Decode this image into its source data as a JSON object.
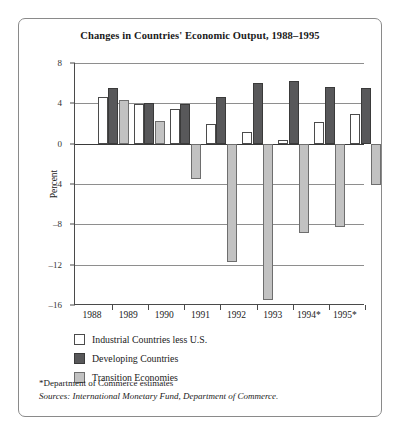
{
  "chart_data": {
    "type": "bar",
    "title": "Changes in Countries' Economic Output, 1988–1995",
    "xlabel": "",
    "ylabel": "Percent",
    "ylim": [
      -16,
      8
    ],
    "yticks": [
      8,
      4,
      0,
      -4,
      -8,
      -12,
      -16
    ],
    "ytick_labels": [
      "8",
      "4",
      "0",
      "–4",
      "–8",
      "–12",
      "–16"
    ],
    "grid": true,
    "legend_position": "below-plot-left",
    "categories": [
      "1988",
      "1989",
      "1990",
      "1991",
      "1992",
      "1993",
      "1994*",
      "1995*"
    ],
    "series": [
      {
        "name": "Industrial Countries less U.S.",
        "color": "#ffffff",
        "values": [
          4.6,
          3.9,
          3.4,
          2.0,
          1.2,
          0.4,
          2.1,
          2.9
        ]
      },
      {
        "name": "Developing Countries",
        "color": "#58585a",
        "values": [
          5.5,
          4.0,
          3.9,
          4.6,
          6.0,
          6.2,
          5.6,
          5.5
        ]
      },
      {
        "name": "Transition Economies",
        "color": "#c2c2c2",
        "values": [
          4.3,
          2.2,
          -3.5,
          -11.7,
          -15.5,
          -8.9,
          -8.3,
          -4.1
        ]
      }
    ],
    "notes": [
      "*Department of Commerce estimates",
      "Sources: International Monetary Fund, Department of Commerce."
    ]
  }
}
